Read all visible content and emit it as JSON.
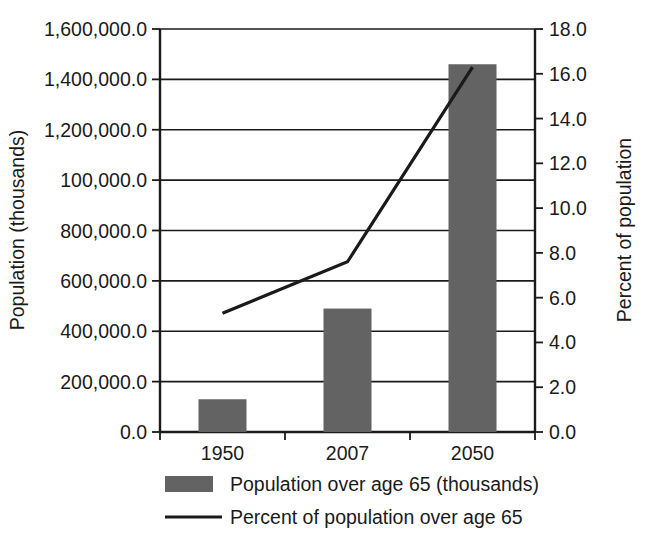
{
  "chart_data": {
    "type": "bar",
    "title": "",
    "subtitle": "",
    "categories": [
      "1950",
      "2007",
      "2050"
    ],
    "series": [
      {
        "name": "Population over age 65 (thousands)",
        "type": "bar",
        "axis": "left",
        "values": [
          130000,
          490000,
          1460000
        ],
        "color": "#636363"
      },
      {
        "name": "Percent of population over age 65",
        "type": "line",
        "axis": "right",
        "values": [
          5.3,
          7.6,
          16.3
        ],
        "color": "#1a1a1a"
      }
    ],
    "xlabel": "",
    "ylabel": "Population (thousands)",
    "y2label": "Percent of population",
    "ylim": [
      0,
      1600000
    ],
    "y2lim": [
      0,
      18
    ],
    "y_ticks": [
      "0.0",
      "200,000.0",
      "400,000.0",
      "600,000.0",
      "800,000.0",
      "100,000.0",
      "1,200,000.0",
      "1,400,000.0",
      "1,600,000.0"
    ],
    "y2_ticks": [
      "0.0",
      "2.0",
      "4.0",
      "6.0",
      "8.0",
      "10.0",
      "12.0",
      "14.0",
      "16.0",
      "18.0"
    ],
    "grid": true,
    "legend_position": "bottom",
    "legend": [
      {
        "label": "Population over age 65 (thousands)",
        "marker": "swatch",
        "color": "#636363"
      },
      {
        "label": "Percent of population over age 65",
        "marker": "line",
        "color": "#1a1a1a"
      }
    ],
    "background": "#ffffff",
    "axis_color": "#1a1a1a"
  }
}
